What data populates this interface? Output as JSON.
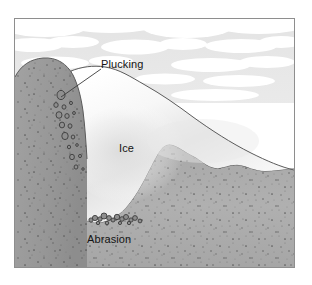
{
  "figure": {
    "kind": "glacial-erosion-cross-section",
    "frame_border_color": "#8e8e8e",
    "background_color": "#ffffff"
  },
  "palette": {
    "sky": "#e6e6e6",
    "cloud": "#ffffff",
    "ice_light": "#fcfcfc",
    "ice_shade": "#dcdcdc",
    "rock_upper": "#9a9a9a",
    "rock_lower": "#ababab",
    "rock_speckle": "#4a4a4a",
    "outline": "#555555",
    "text": "#141414",
    "debris": "#3c3c3c"
  },
  "labels": {
    "plucking": "Plucking",
    "ice": "Ice",
    "abrasion": "Abrasion"
  },
  "annotations": {
    "plucking_leader": {
      "from_x": 86,
      "from_y": 50,
      "to_x": 46,
      "to_y": 78
    }
  },
  "chart_data": {
    "type": "diagram",
    "title": "",
    "elements": [
      {
        "name": "sky",
        "label": ""
      },
      {
        "name": "clouds",
        "label": ""
      },
      {
        "name": "bedrock",
        "label": ""
      },
      {
        "name": "glacier-ice",
        "label": "Ice"
      },
      {
        "name": "plucked-blocks",
        "label": "Plucking"
      },
      {
        "name": "basal-debris",
        "label": "Abrasion"
      }
    ]
  },
  "plucked_blocks": [
    {
      "cx": 46,
      "cy": 76,
      "rx": 4.0,
      "ry": 4.6
    },
    {
      "cx": 41,
      "cy": 86,
      "rx": 2.2,
      "ry": 2.4
    },
    {
      "cx": 49,
      "cy": 88,
      "rx": 2.0,
      "ry": 2.2
    },
    {
      "cx": 56,
      "cy": 84,
      "rx": 1.5,
      "ry": 1.6
    },
    {
      "cx": 44,
      "cy": 96,
      "rx": 3.0,
      "ry": 3.3
    },
    {
      "cx": 52,
      "cy": 97,
      "rx": 2.2,
      "ry": 2.4
    },
    {
      "cx": 59,
      "cy": 94,
      "rx": 1.4,
      "ry": 1.5
    },
    {
      "cx": 47,
      "cy": 106,
      "rx": 2.6,
      "ry": 2.9
    },
    {
      "cx": 55,
      "cy": 107,
      "rx": 2.0,
      "ry": 2.2
    },
    {
      "cx": 50,
      "cy": 117,
      "rx": 3.2,
      "ry": 3.6
    },
    {
      "cx": 58,
      "cy": 118,
      "rx": 1.8,
      "ry": 2.0
    },
    {
      "cx": 54,
      "cy": 128,
      "rx": 1.6,
      "ry": 1.8
    },
    {
      "cx": 62,
      "cy": 126,
      "rx": 1.3,
      "ry": 1.4
    },
    {
      "cx": 57,
      "cy": 138,
      "rx": 2.4,
      "ry": 2.7
    },
    {
      "cx": 65,
      "cy": 137,
      "rx": 1.5,
      "ry": 1.6
    },
    {
      "cx": 61,
      "cy": 148,
      "rx": 1.9,
      "ry": 2.1
    },
    {
      "cx": 68,
      "cy": 150,
      "rx": 1.2,
      "ry": 1.3
    }
  ],
  "basal_debris": [
    {
      "cx": 76,
      "cy": 201,
      "r": 2.1
    },
    {
      "cx": 80,
      "cy": 199,
      "r": 2.6
    },
    {
      "cx": 85,
      "cy": 200,
      "r": 2.2
    },
    {
      "cx": 89,
      "cy": 197,
      "r": 3.0
    },
    {
      "cx": 94,
      "cy": 199,
      "r": 2.4
    },
    {
      "cx": 98,
      "cy": 201,
      "r": 2.0
    },
    {
      "cx": 102,
      "cy": 198,
      "r": 2.7
    },
    {
      "cx": 107,
      "cy": 200,
      "r": 2.3
    },
    {
      "cx": 111,
      "cy": 198,
      "r": 2.5
    },
    {
      "cx": 116,
      "cy": 201,
      "r": 2.1
    },
    {
      "cx": 120,
      "cy": 199,
      "r": 2.4
    },
    {
      "cx": 125,
      "cy": 202,
      "r": 1.9
    },
    {
      "cx": 83,
      "cy": 204,
      "r": 1.7
    },
    {
      "cx": 92,
      "cy": 204,
      "r": 1.8
    },
    {
      "cx": 105,
      "cy": 204,
      "r": 1.6
    },
    {
      "cx": 114,
      "cy": 204,
      "r": 1.7
    }
  ]
}
